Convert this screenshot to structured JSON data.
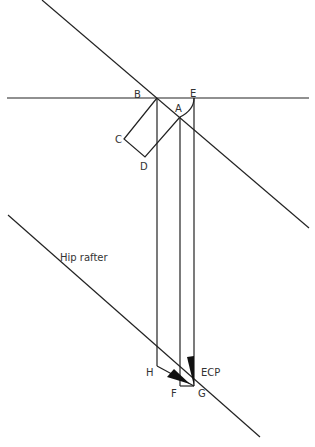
{
  "labels": {
    "B": "B",
    "E": "E",
    "A": "A",
    "C": "C",
    "D": "D",
    "H": "H",
    "F": "F",
    "G": "G",
    "ecp": "ECP",
    "hip_rafter": "Hip rafter"
  },
  "colors": {
    "line": "#222222",
    "text": "#333333",
    "background": "#ffffff"
  }
}
